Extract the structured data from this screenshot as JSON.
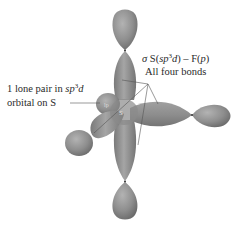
{
  "diagram": {
    "central_atom_label": "S",
    "lone_pair_label_line1_prefix": "1 lone pair in ",
    "lone_pair_label_line1_italic": "sp",
    "lone_pair_label_line1_sup": "3",
    "lone_pair_label_line1_italic2": "d",
    "lone_pair_label_line2": "orbital on S",
    "bond_label_sigma": "σ",
    "bond_label_part1": " S(",
    "bond_label_italic": "sp",
    "bond_label_sup": "3",
    "bond_label_italic2": "d",
    "bond_label_part2": ") – F(",
    "bond_label_p": "p",
    "bond_label_part3": ")",
    "bond_label_line2": "All four bonds",
    "lone_pair_small_label": "lp",
    "colors": {
      "orbital_fill": "#8f8f8f",
      "orbital_dark": "#6e6e6e",
      "orbital_light": "#a9a9a9",
      "leader_line": "#555555",
      "text": "#2a2a2a",
      "background": "#ffffff"
    }
  }
}
